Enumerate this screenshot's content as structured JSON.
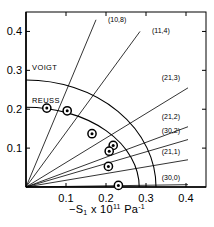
{
  "chart_data": {
    "type": "scatter",
    "title": "",
    "xlabel": "-S₁ x 10¹¹ Pa⁻¹",
    "ylabel": "",
    "xlim": [
      0,
      0.45
    ],
    "ylim": [
      0,
      0.45
    ],
    "grid": false,
    "legend_position": "none",
    "xticks": [
      "0.1",
      "0.2",
      "0.3",
      "0.4"
    ],
    "xtick_values": [
      0.1,
      0.2,
      0.3,
      0.4
    ],
    "yticks": [
      "0.1",
      "0.2",
      "0.3",
      "0.4"
    ],
    "ytick_values": [
      0.1,
      0.2,
      0.3,
      0.4
    ],
    "annotations": [
      {
        "text": "VOIGT",
        "x": 0.01,
        "y": 0.3
      },
      {
        "text": "REUSS",
        "x": 0.01,
        "y": 0.215
      }
    ],
    "radial_lines": [
      {
        "label": "(10,8)",
        "x_end": 0.175,
        "y_end": 0.43,
        "label_x": 0.205,
        "label_y": 0.425
      },
      {
        "label": "(11,4)",
        "x_end": 0.285,
        "y_end": 0.4,
        "label_x": 0.315,
        "label_y": 0.395
      },
      {
        "label": "(21,3)",
        "x_end": 0.405,
        "y_end": 0.255,
        "label_x": 0.385,
        "label_y": 0.275
      },
      {
        "label": "(21,2)",
        "x_end": 0.405,
        "y_end": 0.155,
        "label_x": 0.385,
        "label_y": 0.175
      },
      {
        "label": "(30,2)",
        "x_end": 0.405,
        "y_end": 0.122,
        "label_x": 0.385,
        "label_y": 0.14
      },
      {
        "label": "(21,1)",
        "x_end": 0.405,
        "y_end": 0.07,
        "label_x": 0.385,
        "label_y": 0.085
      },
      {
        "label": "(30,0)",
        "x_end": 0.405,
        "y_end": 0.006,
        "label_x": 0.385,
        "label_y": 0.018
      }
    ],
    "curves": [
      {
        "name": "VOIGT",
        "start": {
          "x": 0.0,
          "y": 0.275
        },
        "end": {
          "x": 0.325,
          "y": 0.0
        }
      },
      {
        "name": "REUSS",
        "start": {
          "x": 0.0,
          "y": 0.205
        },
        "end": {
          "x": 0.283,
          "y": 0.0
        }
      }
    ],
    "points": [
      {
        "x": 0.052,
        "y": 0.203
      },
      {
        "x": 0.103,
        "y": 0.196
      },
      {
        "x": 0.165,
        "y": 0.137
      },
      {
        "x": 0.218,
        "y": 0.107
      },
      {
        "x": 0.208,
        "y": 0.092
      },
      {
        "x": 0.206,
        "y": 0.053
      },
      {
        "x": 0.231,
        "y": 0.004
      }
    ]
  }
}
